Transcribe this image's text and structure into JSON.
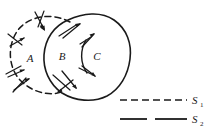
{
  "figure": {
    "background_color": "#ffffff",
    "ink_color": "#1a1a1a"
  },
  "regions": [
    {
      "id": "A",
      "label": "A",
      "x": 30,
      "y": 60,
      "description": "region inside dashed surface S1 only"
    },
    {
      "id": "B",
      "label": "B",
      "x": 62,
      "y": 58,
      "description": "overlap region of S1 and S2"
    },
    {
      "id": "C",
      "label": "C",
      "x": 96,
      "y": 58,
      "description": "region inside solid surface S2 only"
    }
  ],
  "legend": {
    "items": [
      {
        "symbol": "S",
        "subscript": "1",
        "label": "S",
        "style": "dashed",
        "line_kind": "legend-line-dashed"
      },
      {
        "symbol": "S",
        "subscript": "2",
        "label": "S",
        "style": "solid-gapped",
        "line_kind": "legend-line-solid"
      }
    ]
  },
  "curves": {
    "s1": {
      "name": "S1",
      "style": "dashed",
      "path": "M 68 22 C 50 13, 28 17, 18 31 C 8 45, 9 66, 20 79 C 31 92, 51 96, 63 90"
    },
    "s2": {
      "name": "S2",
      "style": "solid",
      "path": "M 62 92 C 50 84, 44 70, 45 56 C 46 40, 55 27, 68 21 C 82 14, 100 12, 113 20 C 126 28, 131 43, 129 58 C 127 74, 120 88, 107 95 C 94 102, 76 101, 62 92 Z"
    },
    "bc_divider": {
      "name": "B-C divider arc",
      "style": "solid",
      "path": "M 86 41 C 81 50, 81 62, 87 72"
    }
  },
  "arrows": [
    {
      "id": "arrow-s1-top",
      "on": "S1",
      "note": "normal arrow near top of dashed circle pointing down-right"
    },
    {
      "id": "arrow-s1-left",
      "on": "S1",
      "note": "normal arrow on left of dashed circle pointing right-down"
    },
    {
      "id": "arrow-s1-lower-left",
      "on": "S1",
      "note": "normal arrow lower-left pointing right-up"
    },
    {
      "id": "arrow-s1-bottom-left",
      "on": "S1",
      "note": "normal arrow bottom-left pointing up-right"
    },
    {
      "id": "arrow-s2-top",
      "on": "S2",
      "note": "normal arrow on upper-left of blob pointing up-right"
    },
    {
      "id": "arrow-s2-bottom",
      "on": "S2",
      "note": "normal arrow on lower edge of blob pointing down-right"
    },
    {
      "id": "arrow-s2-bottom-in",
      "on": "S2",
      "note": "normal arrow at bottom-left of blob pointing down-left"
    },
    {
      "id": "arrow-bc-top",
      "on": "B-C divider",
      "note": "arrow at top of divider arc pointing up-right"
    },
    {
      "id": "arrow-bc-bottom",
      "on": "B-C divider",
      "note": "arrow at bottom of divider arc pointing down-right"
    }
  ]
}
